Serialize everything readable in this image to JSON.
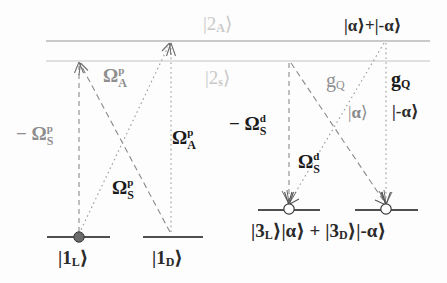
{
  "figure": {
    "width": 447,
    "height": 283,
    "background": "#fdfdfd"
  },
  "colors": {
    "dark": "#2a2a2a",
    "gray": "#8e8e8e",
    "faint": "#c9c9c9",
    "level_line": "#5a5a5a",
    "excited_line": "#bdbdbd"
  },
  "levels": {
    "excited": [
      {
        "name": "excited-upper-line",
        "label": "|2_A>",
        "label_html": "|2<span class='sub'>A</span>&rang;",
        "style": "faint",
        "y": 41
      },
      {
        "name": "excited-lower-line",
        "label": "|2_s>",
        "label_html": "|2<span class='sub'>s</span>&rang;",
        "style": "faint",
        "y": 61
      }
    ],
    "ground": [
      {
        "name": "ground-1L",
        "label": "|1_L>",
        "label_html": "|1<span class='sub'>L</span>&rang;",
        "marker": "filled-circle",
        "y": 237
      },
      {
        "name": "ground-1D",
        "label": "|1_D>",
        "label_html": "|1<span class='sub'>D</span>&rang;",
        "marker": "none",
        "y": 237
      }
    ],
    "dressed": [
      {
        "name": "dressed-3L",
        "marker": "open-circle",
        "y": 210
      },
      {
        "name": "dressed-3D",
        "marker": "open-circle",
        "y": 210
      }
    ]
  },
  "labels": {
    "excited_upper": "|2_A>",
    "excited_lower": "|2_s>",
    "cat_state_top": "|α>+|-α>",
    "alpha_left": "|α>",
    "alpha_right": "|-α>",
    "ground_left": "|1_L>",
    "ground_right": "|1_D>",
    "dressed_combined": "|3_L>|α> + |3_D>|-α>",
    "omega_S_p_neg": "- Ω_S^p",
    "omega_A_p_gray": "Ω_A^p",
    "omega_A_p_bold": "Ω_A^p",
    "omega_S_p_bold": "Ω_S^p",
    "omega_S_d_neg": "- Ω_S^d",
    "omega_S_d_bold": "Ω_S^d",
    "g_Q_left": "g_Q",
    "g_Q_right": "g_Q",
    "greek_omega": "Ω",
    "greek_alpha": "α"
  },
  "transitions": [
    {
      "name": "transition-1L-to-2s-dashed",
      "style": "dashed",
      "color": "gray",
      "arrow": "up"
    },
    {
      "name": "transition-1D-to-2A-dotted",
      "style": "dotted",
      "color": "gray",
      "arrow": "up"
    },
    {
      "name": "transition-1D-to-2s-dashed-diagonal",
      "style": "dashed",
      "color": "gray",
      "arrow": "up"
    },
    {
      "name": "transition-1L-to-2A-dotted-diagonal",
      "style": "dotted",
      "color": "gray",
      "arrow": "up"
    },
    {
      "name": "transition-2s-to-3L-dashed",
      "style": "dashed",
      "color": "gray",
      "arrow": "down"
    },
    {
      "name": "transition-2A-to-3D-dotted",
      "style": "dotted",
      "color": "gray",
      "arrow": "down"
    },
    {
      "name": "transition-2s-to-3D-dashed-diagonal",
      "style": "dashed",
      "color": "gray",
      "arrow": "down"
    },
    {
      "name": "transition-2A-to-3L-dotted-diagonal",
      "style": "dotted",
      "color": "gray",
      "arrow": "down"
    }
  ]
}
